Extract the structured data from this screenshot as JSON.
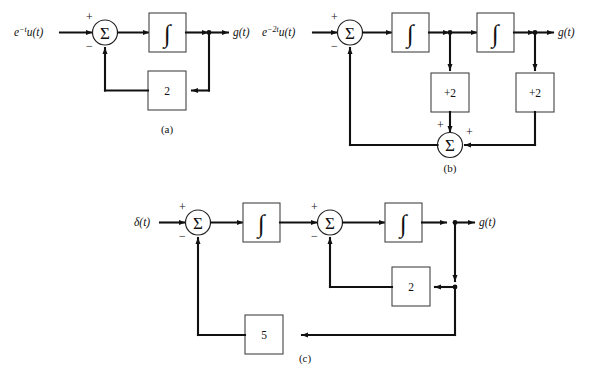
{
  "figure": {
    "type": "signal-flow block diagrams",
    "background": "#ffffff",
    "line_color": "#111111"
  },
  "subfigures": [
    {
      "id": "a",
      "caption": "(a)",
      "input_label": "e",
      "input_exponent": "−t",
      "input_rest": "u(t)",
      "output_label": "g(t)",
      "summer_symbol": "Σ",
      "summer_plus": "+",
      "summer_minus": "−",
      "integrator_symbol": "∫",
      "feedback_gain": "2"
    },
    {
      "id": "b",
      "caption": "(b)",
      "input_label": "e",
      "input_exponent": "−2t",
      "input_rest": "u(t)",
      "output_label": "g(t)",
      "summer_symbol": "Σ",
      "summer_plus": "+",
      "summer_minus": "−",
      "integrator_symbol": "∫",
      "gain_first": "+2",
      "gain_second": "+2",
      "bottom_summer_symbol": "Σ",
      "bottom_summer_left_sign": "+",
      "bottom_summer_right_sign": "+"
    },
    {
      "id": "c",
      "caption": "(c)",
      "input_label": "δ(t)",
      "output_label": "g(t)",
      "summer_symbol": "Σ",
      "summer_plus": "+",
      "summer_minus": "−",
      "integrator_symbol": "∫",
      "inner_feedback_gain": "2",
      "outer_feedback_gain": "5"
    }
  ]
}
